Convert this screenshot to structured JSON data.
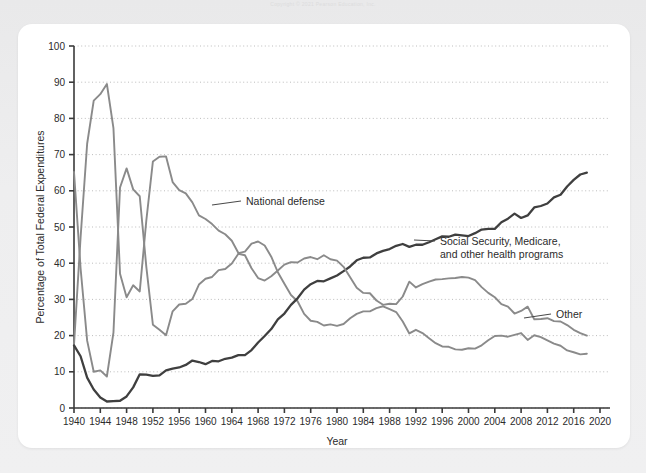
{
  "page": {
    "background_color": "#ecedee",
    "card_color": "#ffffff",
    "header_faint_text": "Copyright © 2021 Pearson Education, Inc."
  },
  "chart_data": {
    "type": "line",
    "title": "",
    "xlabel": "Year",
    "ylabel": "Percentage of Total Federal Expenditures",
    "xlim": [
      1940,
      2020
    ],
    "ylim": [
      0,
      100
    ],
    "xticks": [
      1940,
      1944,
      1948,
      1952,
      1956,
      1960,
      1964,
      1968,
      1972,
      1976,
      1980,
      1984,
      1988,
      1992,
      1996,
      2000,
      2004,
      2008,
      2012,
      2016,
      2020
    ],
    "yticks": [
      0,
      10,
      20,
      30,
      40,
      50,
      60,
      70,
      80,
      90,
      100
    ],
    "grid": "horizontal-dotted",
    "legend": "inline-annotations",
    "colors": {
      "national_defense": "#8a8a8a",
      "social_security": "#3f3f3f",
      "other": "#8a8a8a",
      "axis": "#3a3a3a",
      "grid": "#b6b6b6"
    },
    "x": [
      1940,
      1941,
      1942,
      1943,
      1944,
      1945,
      1946,
      1947,
      1948,
      1949,
      1950,
      1951,
      1952,
      1953,
      1954,
      1955,
      1956,
      1957,
      1958,
      1959,
      1960,
      1961,
      1962,
      1963,
      1964,
      1965,
      1966,
      1967,
      1968,
      1969,
      1970,
      1971,
      1972,
      1973,
      1974,
      1975,
      1976,
      1977,
      1978,
      1979,
      1980,
      1981,
      1982,
      1983,
      1984,
      1985,
      1986,
      1987,
      1988,
      1989,
      1990,
      1991,
      1992,
      1993,
      1994,
      1995,
      1996,
      1997,
      1998,
      1999,
      2000,
      2001,
      2002,
      2003,
      2004,
      2005,
      2006,
      2007,
      2008,
      2009,
      2010,
      2011,
      2012,
      2013,
      2014,
      2015,
      2016,
      2017,
      2018
    ],
    "series": [
      {
        "name": "National defense",
        "color": "#8a8a8a",
        "values": [
          17.5,
          47.1,
          73.0,
          84.9,
          86.7,
          89.5,
          77.3,
          37.1,
          30.6,
          33.9,
          32.2,
          51.8,
          68.1,
          69.4,
          69.5,
          62.4,
          60.2,
          59.3,
          56.8,
          53.2,
          52.2,
          50.8,
          49.0,
          48.0,
          46.2,
          42.8,
          43.2,
          45.4,
          46.0,
          44.9,
          41.8,
          37.5,
          34.3,
          31.2,
          29.5,
          26.0,
          24.1,
          23.8,
          22.8,
          23.1,
          22.7,
          23.2,
          24.8,
          26.0,
          26.7,
          26.7,
          27.6,
          28.1,
          27.3,
          26.5,
          23.9,
          20.6,
          21.6,
          20.7,
          19.3,
          17.9,
          17.0,
          16.9,
          16.2,
          16.1,
          16.5,
          16.4,
          17.3,
          18.7,
          19.9,
          20.0,
          19.7,
          20.2,
          20.7,
          18.8,
          20.1,
          19.6,
          18.7,
          17.8,
          17.2,
          15.9,
          15.4,
          14.8,
          15.0
        ]
      },
      {
        "name": "Social Security, Medicare, and other health programs",
        "color": "#3f3f3f",
        "values": [
          17.3,
          14.3,
          8.4,
          5.1,
          2.9,
          1.8,
          1.9,
          2.0,
          3.2,
          5.7,
          9.3,
          9.2,
          8.9,
          9.0,
          10.4,
          10.9,
          11.2,
          11.9,
          13.1,
          12.7,
          12.1,
          13.0,
          12.9,
          13.6,
          13.9,
          14.6,
          14.6,
          16.0,
          18.1,
          19.9,
          21.8,
          24.5,
          26.1,
          28.5,
          30.3,
          32.7,
          34.2,
          35.1,
          35.0,
          35.8,
          36.6,
          37.8,
          39.1,
          40.8,
          41.5,
          41.6,
          42.7,
          43.4,
          43.9,
          44.8,
          45.3,
          44.5,
          45.1,
          45.1,
          45.8,
          46.6,
          47.4,
          47.3,
          47.9,
          47.7,
          47.5,
          48.3,
          49.3,
          49.5,
          49.5,
          51.3,
          52.3,
          53.7,
          52.5,
          53.2,
          55.4,
          55.8,
          56.5,
          58.2,
          58.9,
          61.2,
          63.0,
          64.5,
          65.0
        ]
      },
      {
        "name": "Other",
        "color": "#8a8a8a",
        "values": [
          65.2,
          38.6,
          18.6,
          10.0,
          10.4,
          8.7,
          20.8,
          60.9,
          66.2,
          60.4,
          58.5,
          39.0,
          23.0,
          21.6,
          20.1,
          26.7,
          28.6,
          28.8,
          30.1,
          34.1,
          35.7,
          36.2,
          38.1,
          38.4,
          39.9,
          42.6,
          42.2,
          38.6,
          35.9,
          35.2,
          36.4,
          38.0,
          39.6,
          40.3,
          40.2,
          41.3,
          41.7,
          41.1,
          42.2,
          41.1,
          40.7,
          39.0,
          36.1,
          33.2,
          31.8,
          31.7,
          29.7,
          28.5,
          28.8,
          28.7,
          30.8,
          34.9,
          33.3,
          34.2,
          34.9,
          35.5,
          35.6,
          35.8,
          35.9,
          36.2,
          36.0,
          35.3,
          33.4,
          31.8,
          30.6,
          28.7,
          28.0,
          26.1,
          26.8,
          28.0,
          24.5,
          24.6,
          24.8,
          24.0,
          23.9,
          22.9,
          21.6,
          20.7,
          20.0
        ]
      }
    ],
    "annotations": [
      {
        "label": "National defense",
        "x_px": 246,
        "y_px": 205,
        "leader_from_x": 212,
        "leader_from_y": 205
      },
      {
        "label": "Social Security, Medicare,",
        "x_px": 440,
        "y_px": 245,
        "leader_from_x": 414,
        "leader_from_y": 240
      },
      {
        "label": "and other health programs",
        "x_px": 440,
        "y_px": 258,
        "leader_from_x": null,
        "leader_from_y": null
      },
      {
        "label": "Other",
        "x_px": 556,
        "y_px": 318,
        "leader_from_x": 524,
        "leader_from_y": 318
      }
    ]
  }
}
